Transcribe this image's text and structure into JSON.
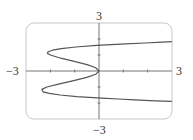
{
  "chart_data": {
    "type": "line",
    "title": "",
    "xlabel": "",
    "ylabel": "",
    "xlim": [
      -3,
      3
    ],
    "ylim": [
      -3,
      3
    ],
    "grid": false,
    "legend": null,
    "tick_labels": {
      "x_min": "−3",
      "x_max": "3",
      "y_min": "−3",
      "y_max": "3"
    },
    "x_ticks": [
      -2,
      -1,
      1,
      2
    ],
    "y_ticks": [
      -2,
      -1,
      1,
      2
    ],
    "series": [
      {
        "name": "curve",
        "color": "#555555",
        "points": [
          [
            3.0,
            1.83
          ],
          [
            2.6,
            1.8
          ],
          [
            1.9,
            1.75
          ],
          [
            1.09,
            1.7
          ],
          [
            0.5,
            1.65
          ],
          [
            -0.09,
            1.6
          ],
          [
            -0.95,
            1.5
          ],
          [
            -1.55,
            1.4
          ],
          [
            -1.91,
            1.3
          ],
          [
            -2.1,
            1.2
          ],
          [
            -2.12,
            1.1
          ],
          [
            -2.0,
            1.0
          ],
          [
            -1.57,
            0.8
          ],
          [
            -1.02,
            0.6
          ],
          [
            -0.49,
            0.4
          ],
          [
            -0.13,
            0.2
          ],
          [
            0.0,
            0.0
          ],
          [
            -0.13,
            -0.2
          ],
          [
            -0.5,
            -0.4
          ],
          [
            -1.04,
            -0.6
          ],
          [
            -1.62,
            -0.8
          ],
          [
            -2.15,
            -1.0
          ],
          [
            -2.35,
            -1.15
          ],
          [
            -2.3,
            -1.3
          ],
          [
            -2.05,
            -1.4
          ],
          [
            -1.6,
            -1.5
          ],
          [
            -0.91,
            -1.6
          ],
          [
            0.11,
            -1.7
          ],
          [
            0.8,
            -1.75
          ],
          [
            1.47,
            -1.8
          ],
          [
            2.3,
            -1.86
          ],
          [
            3.0,
            -1.9
          ]
        ]
      }
    ]
  }
}
